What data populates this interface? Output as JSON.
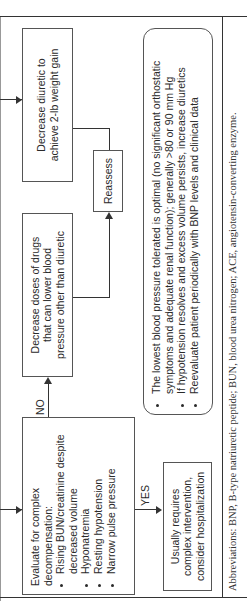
{
  "boxes": {
    "decrease_diuretic": "Decrease diuretic to achieve 2-lb weight gain",
    "reassess": "Reassess",
    "decrease_doses": "Decrease doses of drugs that can lower blood pressure other than diuretic",
    "evaluate": {
      "heading": "Evaluate for complex decompensation:",
      "items": [
        "Rising BUN/creatinine despite decreased volume",
        "Hyponatremia",
        "Resting hypotension",
        "Narrow pulse pressure"
      ]
    },
    "usually_requires": "Usually requires complex intervention, consider hospitalization"
  },
  "labels": {
    "no": "NO",
    "yes": "YES"
  },
  "note": {
    "items": [
      "The lowest blood pressure tolerated is optimal (no significant orthostatic symptoms and adequate renal function); generally >80 or 90 mm Hg",
      "If hypotension resolves and excess volume persists, increase diuretics",
      "Reevaluate patient periodically with BNP levels and clinical data"
    ]
  },
  "footer": {
    "abbreviations": "Abbreviations: BNP, B-type natriuretic peptide; BUN, blood urea nitrogen; ACE, angiotensin-converting enzyme."
  }
}
